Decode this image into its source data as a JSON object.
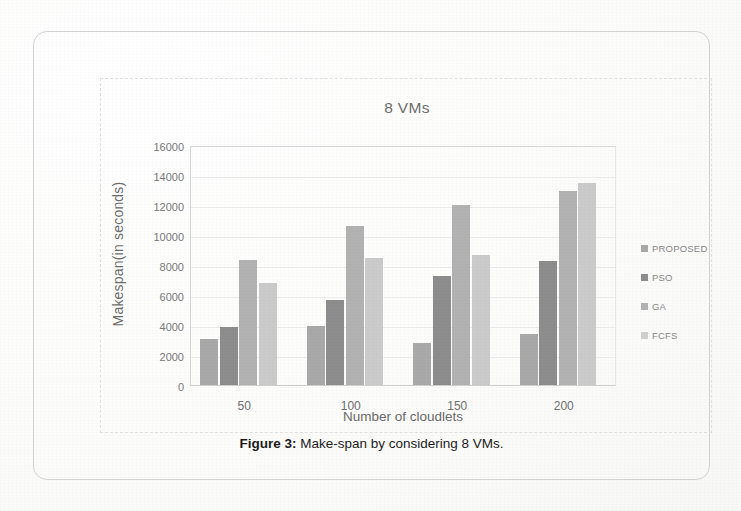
{
  "figure": {
    "caption_label": "Figure 3:",
    "caption_text": " Make-span by considering 8 VMs."
  },
  "chart_data": {
    "type": "bar",
    "title": "8 VMs",
    "xlabel": "Number of cloudlets",
    "ylabel": "Makespan(in seconds)",
    "categories": [
      "50",
      "100",
      "150",
      "200"
    ],
    "series": [
      {
        "name": "PROPOSED",
        "color": "#a9a9a9",
        "values": [
          3100,
          3950,
          2800,
          3400
        ]
      },
      {
        "name": "PSO",
        "color": "#8d8d8d",
        "values": [
          3850,
          5650,
          7250,
          8300
        ]
      },
      {
        "name": "GA",
        "color": "#b2b2b2",
        "values": [
          8350,
          10600,
          12000,
          12950
        ]
      },
      {
        "name": "FCFS",
        "color": "#cbcbcb",
        "values": [
          6800,
          8500,
          8700,
          13450
        ]
      }
    ],
    "ylim": [
      0,
      16000
    ],
    "ytick_values": [
      0,
      2000,
      4000,
      6000,
      8000,
      10000,
      12000,
      14000,
      16000
    ],
    "ytick_labels": [
      "0",
      "2000",
      "4000",
      "6000",
      "8000",
      "10000",
      "12000",
      "14000",
      "16000"
    ],
    "grid": true,
    "legend_position": "right"
  }
}
